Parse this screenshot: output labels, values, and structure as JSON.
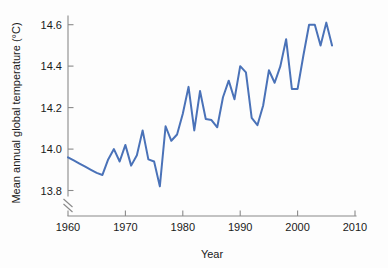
{
  "chart_data": {
    "type": "line",
    "title": "",
    "xlabel": "Year",
    "ylabel": "Mean annual global temperature (°C)",
    "xlim": [
      1960,
      2010
    ],
    "ylim": [
      13.78,
      14.66
    ],
    "xticks": [
      1960,
      1970,
      1980,
      1990,
      2000,
      2010
    ],
    "xtick_labels": [
      "1960",
      "1970",
      "1980",
      "1990",
      "2000",
      "2010"
    ],
    "yticks": [
      13.8,
      14.0,
      14.2,
      14.4,
      14.6
    ],
    "ytick_labels": [
      "13.8",
      "14.0",
      "14.2",
      "14.4",
      "14.6"
    ],
    "grid": false,
    "legend": false,
    "axis_break": true,
    "line_color": "#4a72b8",
    "axis_color": "#8a8a8a",
    "background_color": "#fdfdfd",
    "x": [
      1960,
      1961,
      1962,
      1963,
      1964,
      1965,
      1966,
      1967,
      1968,
      1969,
      1970,
      1971,
      1972,
      1973,
      1974,
      1975,
      1976,
      1977,
      1978,
      1979,
      1980,
      1981,
      1982,
      1983,
      1984,
      1985,
      1986,
      1987,
      1988,
      1989,
      1990,
      1991,
      1992,
      1993,
      1994,
      1995,
      1996,
      1997,
      1998,
      1999,
      2000,
      2001,
      2002,
      2003,
      2004,
      2005,
      2006
    ],
    "values": [
      13.96,
      13.945,
      13.93,
      13.915,
      13.9,
      13.885,
      13.875,
      13.95,
      14.0,
      13.94,
      14.02,
      13.92,
      13.97,
      14.09,
      13.95,
      13.94,
      13.82,
      14.11,
      14.04,
      14.07,
      14.17,
      14.3,
      14.09,
      14.28,
      14.145,
      14.14,
      14.105,
      14.25,
      14.33,
      14.24,
      14.4,
      14.37,
      14.15,
      14.115,
      14.21,
      14.38,
      14.32,
      14.4,
      14.53,
      14.29,
      14.29,
      14.45,
      14.6,
      14.6,
      14.5,
      14.61,
      14.5
    ],
    "series_name": "Mean annual global temperature"
  }
}
